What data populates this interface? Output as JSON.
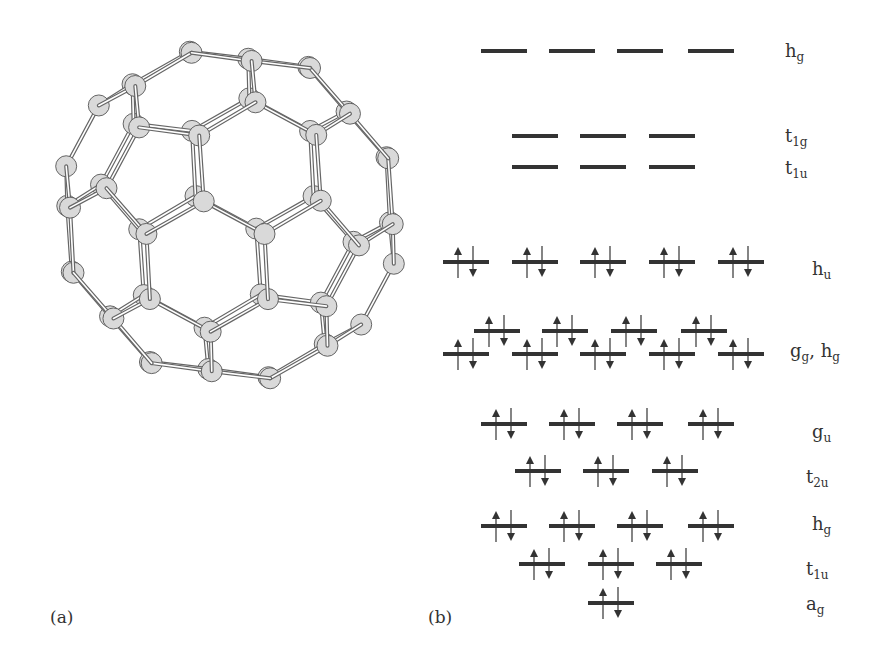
{
  "figure": {
    "panel_a_label": "(a)",
    "panel_b_label": "(b)",
    "molecule": {
      "name": "C60 buckminsterfullerene",
      "atom_fill": "#d9d9d9",
      "atom_stroke": "#555555",
      "bond_color": "#666666"
    },
    "diagram": {
      "line_color": "#333333",
      "levels": [
        {
          "id": "hg-empty",
          "label_main": "h",
          "label_sub": "g",
          "label_extra": "",
          "label_extra_sub": "",
          "label_x": 785,
          "label_y": 40,
          "y": 51,
          "occupied": false,
          "x_starts": [
            481,
            549,
            617,
            688
          ]
        },
        {
          "id": "t1g",
          "label_main": "t",
          "label_sub": "1g",
          "label_extra": "",
          "label_extra_sub": "",
          "label_x": 785,
          "label_y": 125,
          "y": 136,
          "occupied": false,
          "x_starts": [
            512,
            580,
            649
          ]
        },
        {
          "id": "t1u-empty",
          "label_main": "t",
          "label_sub": "1u",
          "label_extra": "",
          "label_extra_sub": "",
          "label_x": 785,
          "label_y": 157,
          "y": 167,
          "occupied": false,
          "x_starts": [
            512,
            580,
            649
          ]
        },
        {
          "id": "hu",
          "label_main": "h",
          "label_sub": "u",
          "label_extra": "",
          "label_extra_sub": "",
          "label_x": 812,
          "label_y": 258,
          "y": 262,
          "occupied": true,
          "x_starts": [
            443,
            512,
            580,
            649,
            718
          ]
        },
        {
          "id": "gg",
          "label_main": "g",
          "label_sub": "g",
          "label_extra": ", h",
          "label_extra_sub": "g",
          "label_x": 790,
          "label_y": 340,
          "y": 331,
          "occupied": true,
          "x_starts": [
            474,
            542,
            611,
            681
          ]
        },
        {
          "id": "hg-lower",
          "label_main": "",
          "label_sub": "",
          "label_extra": "",
          "label_extra_sub": "",
          "label_x": 0,
          "label_y": 0,
          "y": 354,
          "occupied": true,
          "x_starts": [
            443,
            512,
            580,
            649,
            718
          ]
        },
        {
          "id": "gu",
          "label_main": "g",
          "label_sub": "u",
          "label_extra": "",
          "label_extra_sub": "",
          "label_x": 812,
          "label_y": 421,
          "y": 424,
          "occupied": true,
          "x_starts": [
            481,
            549,
            617,
            688
          ]
        },
        {
          "id": "t2u",
          "label_main": "t",
          "label_sub": "2u",
          "label_extra": "",
          "label_extra_sub": "",
          "label_x": 806,
          "label_y": 466,
          "y": 471,
          "occupied": true,
          "x_starts": [
            515,
            583,
            652
          ]
        },
        {
          "id": "hg-occ",
          "label_main": "h",
          "label_sub": "g",
          "label_extra": "",
          "label_extra_sub": "",
          "label_x": 812,
          "label_y": 513,
          "y": 526,
          "occupied": true,
          "x_starts": [
            481,
            549,
            617,
            688
          ]
        },
        {
          "id": "t1u-occ",
          "label_main": "t",
          "label_sub": "1u",
          "label_extra": "",
          "label_extra_sub": "",
          "label_x": 806,
          "label_y": 558,
          "y": 564,
          "occupied": true,
          "x_starts": [
            519,
            588,
            656
          ]
        },
        {
          "id": "ag",
          "label_main": "a",
          "label_sub": "g",
          "label_extra": "",
          "label_extra_sub": "",
          "label_x": 806,
          "label_y": 593,
          "y": 603,
          "occupied": true,
          "x_starts": [
            588
          ]
        }
      ],
      "level_width": 46
    }
  }
}
